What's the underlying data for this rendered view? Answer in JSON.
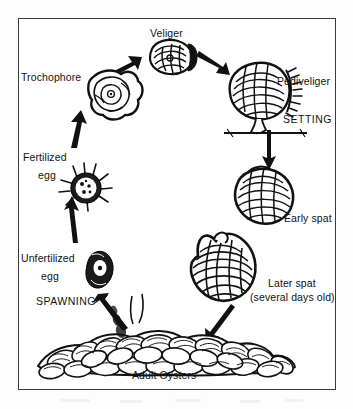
{
  "figure": {
    "frame": {
      "stroke_color": "#3a3a3a"
    },
    "background_color": "#ffffff",
    "ink_color": "#111111"
  },
  "labels": {
    "veliger": "Veliger",
    "trochophore": "Trochophore",
    "pediveliger": "Pediveliger",
    "setting": "SETTING",
    "fertilized_egg_line1": "Fertilized",
    "fertilized_egg_line2": "egg",
    "unfertilized_egg_line1": "Unfertilized",
    "unfertilized_egg_line2": "egg",
    "spawning": "SPAWNING",
    "early_spat": "Early spat",
    "later_spat_line1": "Later spat",
    "later_spat_line2": "(several days old)",
    "adult_oysters": "Adult Oysters"
  },
  "stages": [
    {
      "name": "unfertilized-egg",
      "label": "Unfertilized egg"
    },
    {
      "name": "fertilized-egg",
      "label": "Fertilized egg"
    },
    {
      "name": "trochophore",
      "label": "Trochophore"
    },
    {
      "name": "veliger",
      "label": "Veliger"
    },
    {
      "name": "pediveliger",
      "label": "Pediveliger"
    },
    {
      "name": "early-spat",
      "label": "Early spat"
    },
    {
      "name": "later-spat",
      "label": "Later spat (several days old)"
    },
    {
      "name": "adult-oysters",
      "label": "Adult Oysters"
    }
  ],
  "processes": [
    {
      "name": "spawning",
      "label": "SPAWNING"
    },
    {
      "name": "setting",
      "label": "SETTING"
    }
  ]
}
